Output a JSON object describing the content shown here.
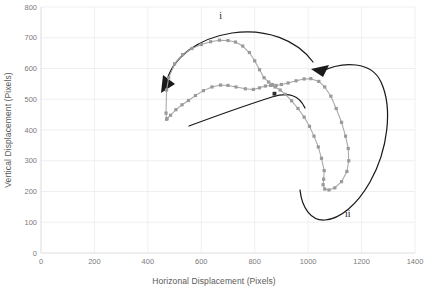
{
  "chart_data": {
    "type": "scatter",
    "title": "",
    "xlabel": "Horizonal Displacement (Pixels)",
    "ylabel": "Vertical Displacement (Pixels)",
    "xlim": [
      0,
      1400
    ],
    "ylim": [
      0,
      800
    ],
    "xticks": [
      0,
      200,
      400,
      600,
      800,
      1000,
      1200,
      1400
    ],
    "yticks": [
      0,
      100,
      200,
      300,
      400,
      500,
      600,
      700,
      800
    ],
    "xtick_labels": [
      "0",
      "200",
      "400",
      "600",
      "800",
      "1000",
      "1200",
      "1400"
    ],
    "ytick_labels": [
      "0",
      "100",
      "200",
      "300",
      "400",
      "500",
      "600",
      "700",
      "800"
    ],
    "grid": true,
    "legend": "none",
    "marker_color": "#9a9a9a",
    "line_color": "#a6a6a6",
    "annotation_color": "#1a1a1a",
    "series": [
      {
        "name": "trajectory",
        "marker": "square",
        "points": [
          [
            470,
            435
          ],
          [
            468,
            455
          ],
          [
            470,
            530
          ],
          [
            478,
            570
          ],
          [
            500,
            615
          ],
          [
            530,
            645
          ],
          [
            565,
            665
          ],
          [
            600,
            678
          ],
          [
            635,
            687
          ],
          [
            668,
            692
          ],
          [
            700,
            691
          ],
          [
            728,
            686
          ],
          [
            755,
            673
          ],
          [
            780,
            652
          ],
          [
            800,
            625
          ],
          [
            818,
            596
          ],
          [
            835,
            570
          ],
          [
            852,
            556
          ],
          [
            866,
            548
          ],
          [
            880,
            545
          ],
          [
            900,
            548
          ],
          [
            925,
            553
          ],
          [
            955,
            560
          ],
          [
            985,
            566
          ],
          [
            1010,
            567
          ],
          [
            1040,
            558
          ],
          [
            1062,
            540
          ],
          [
            1085,
            510
          ],
          [
            1105,
            470
          ],
          [
            1125,
            425
          ],
          [
            1140,
            380
          ],
          [
            1150,
            340
          ],
          [
            1152,
            300
          ],
          [
            1145,
            265
          ],
          [
            1125,
            232
          ],
          [
            1100,
            212
          ],
          [
            1078,
            205
          ],
          [
            1062,
            208
          ],
          [
            1056,
            222
          ],
          [
            1058,
            240
          ],
          [
            1060,
            268
          ],
          [
            1050,
            308
          ],
          [
            1038,
            345
          ],
          [
            1022,
            380
          ],
          [
            1005,
            412
          ],
          [
            985,
            442
          ],
          [
            962,
            470
          ],
          [
            938,
            495
          ],
          [
            915,
            516
          ],
          [
            895,
            530
          ],
          [
            876,
            540
          ],
          [
            860,
            545
          ],
          [
            840,
            543
          ],
          [
            818,
            537
          ],
          [
            795,
            532
          ],
          [
            765,
            534
          ],
          [
            730,
            540
          ],
          [
            700,
            545
          ],
          [
            672,
            546
          ],
          [
            640,
            540
          ],
          [
            608,
            528
          ],
          [
            578,
            512
          ],
          [
            552,
            496
          ],
          [
            528,
            482
          ],
          [
            505,
            466
          ],
          [
            485,
            448
          ],
          [
            472,
            437
          ]
        ]
      }
    ],
    "extra_points": [
      {
        "name": "center-marker",
        "x": 874,
        "y": 518
      }
    ],
    "annotations": [
      {
        "label": "i",
        "x": 672,
        "y": 762,
        "kind": "roman-numeral-one"
      },
      {
        "label": "ii",
        "x": 1148,
        "y": 118,
        "kind": "roman-numeral-two"
      }
    ],
    "arrows": [
      {
        "name": "arrow-upper-counterclockwise",
        "direction": "down-left",
        "description": "long curved arrow arcing over the upper lobe pointing left-down"
      },
      {
        "name": "arrow-lower-right-inflow",
        "direction": "left",
        "description": "curved arrow coming up the right side pointing left"
      },
      {
        "name": "arrow-lower-sweep",
        "direction": "left",
        "description": "curve sweeping beneath the lower lobe"
      }
    ]
  },
  "axis": {
    "x_title": "Horizonal Displacement (Pixels)",
    "y_title": "Vertical Displacement (Pixels)"
  }
}
